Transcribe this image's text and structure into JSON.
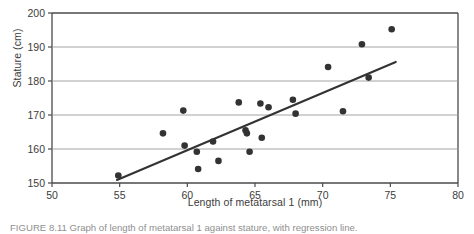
{
  "figure": {
    "caption": "FIGURE 8.11   Graph of length of metatarsal 1 against stature, with regression line."
  },
  "chart_data": {
    "type": "scatter",
    "title": "",
    "xlabel": "Length of metatarsal 1 (mm)",
    "ylabel": "Stature (cm)",
    "xlim": [
      50,
      80
    ],
    "ylim": [
      150,
      200
    ],
    "xticks": [
      50,
      55,
      60,
      65,
      70,
      75,
      80
    ],
    "yticks": [
      150,
      160,
      170,
      180,
      190,
      200
    ],
    "grid": "horizontal",
    "legend": "none",
    "marker_color": "#333333",
    "line_color": "#333333",
    "points": [
      {
        "x": 54.9,
        "y": 152.2
      },
      {
        "x": 58.2,
        "y": 164.6
      },
      {
        "x": 59.7,
        "y": 171.3
      },
      {
        "x": 59.8,
        "y": 161.0
      },
      {
        "x": 60.7,
        "y": 159.2
      },
      {
        "x": 60.8,
        "y": 154.1
      },
      {
        "x": 61.9,
        "y": 162.2
      },
      {
        "x": 62.3,
        "y": 156.5
      },
      {
        "x": 63.8,
        "y": 173.7
      },
      {
        "x": 64.3,
        "y": 165.5
      },
      {
        "x": 64.4,
        "y": 164.6
      },
      {
        "x": 64.6,
        "y": 159.2
      },
      {
        "x": 65.4,
        "y": 173.4
      },
      {
        "x": 65.5,
        "y": 163.3
      },
      {
        "x": 66.0,
        "y": 172.3
      },
      {
        "x": 67.8,
        "y": 174.5
      },
      {
        "x": 68.0,
        "y": 170.4
      },
      {
        "x": 70.4,
        "y": 184.1
      },
      {
        "x": 71.5,
        "y": 171.1
      },
      {
        "x": 72.9,
        "y": 190.8
      },
      {
        "x": 73.4,
        "y": 181.0
      },
      {
        "x": 75.1,
        "y": 195.2
      }
    ],
    "regression_line": {
      "x1": 54.8,
      "y1": 150.9,
      "x2": 75.4,
      "y2": 185.6
    }
  }
}
